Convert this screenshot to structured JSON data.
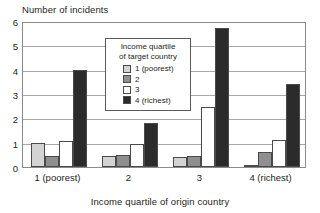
{
  "chart_data": {
    "type": "bar",
    "title": "",
    "ylabel": "Number of incidents",
    "xlabel": "Income quartile of origin country",
    "categories": [
      "1 (poorest)",
      "2",
      "3",
      "4 (richest)"
    ],
    "ylim": [
      0,
      6
    ],
    "yticks": [
      0,
      1,
      2,
      3,
      4,
      5,
      6
    ],
    "ytick_labels": [
      "0",
      "1",
      "2",
      "3",
      "4",
      "5",
      "6"
    ],
    "grid": true,
    "grid_axis": "y",
    "legend_position": "upper center",
    "legend_title": "Income quartile\nof target country",
    "legend_title_line1": "Income quartile",
    "legend_title_line2": "of target country",
    "series": [
      {
        "name": "1 (poorest)",
        "color": "#d3d3d3",
        "values": [
          1.0,
          0.45,
          0.4,
          0.05
        ]
      },
      {
        "name": "2",
        "color": "#8f8f8f",
        "values": [
          0.45,
          0.5,
          0.45,
          0.6
        ]
      },
      {
        "name": "3",
        "color": "#ffffff",
        "values": [
          1.05,
          0.95,
          2.45,
          1.1
        ]
      },
      {
        "name": "4 (richest)",
        "color": "#2b2b2b",
        "values": [
          4.0,
          1.8,
          5.7,
          3.4
        ]
      }
    ]
  },
  "colors": {
    "axis": "#8a8a8a",
    "grid": "#a8a8a8",
    "bar_edge": "#4a4a4a",
    "text": "#231f20",
    "background": "#ffffff"
  }
}
